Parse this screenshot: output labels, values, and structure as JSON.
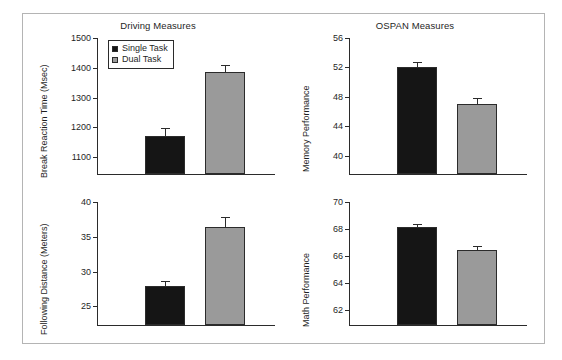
{
  "figure": {
    "background": "#ffffff",
    "frame_color": "#b4b4b4"
  },
  "legend": {
    "entries": [
      {
        "label": "Single Task",
        "color": "#151515",
        "key": "single"
      },
      {
        "label": "Dual Task",
        "color": "#9a9a9a",
        "key": "dual"
      }
    ]
  },
  "chart_data": [
    {
      "type": "bar",
      "panel": "top-left",
      "title": "Driving Measures",
      "xlabel": "",
      "ylabel": "Break Reaction Time (Msec)",
      "categories": [
        "Single Task",
        "Dual Task"
      ],
      "values": [
        1168,
        1383
      ],
      "errors": [
        30,
        28
      ],
      "ylim": [
        1040,
        1500
      ],
      "yticks": [
        1100,
        1200,
        1300,
        1400,
        1500
      ],
      "ytick_labels": [
        "1100",
        "1200",
        "1300",
        "1400",
        "1500"
      ],
      "grid": false,
      "legend_position": "upper left",
      "colors": [
        "#151515",
        "#9a9a9a"
      ]
    },
    {
      "type": "bar",
      "panel": "top-right",
      "title": "OSPAN Measures",
      "xlabel": "",
      "ylabel": "Memory Performance",
      "categories": [
        "Single Task",
        "Dual Task"
      ],
      "values": [
        51.9,
        46.9
      ],
      "errors": [
        0.8,
        0.9
      ],
      "ylim": [
        37.4,
        56
      ],
      "yticks": [
        40,
        44,
        48,
        52,
        56
      ],
      "ytick_labels": [
        "40",
        "44",
        "48",
        "52",
        "56"
      ],
      "grid": false,
      "legend_position": "none",
      "colors": [
        "#151515",
        "#9a9a9a"
      ]
    },
    {
      "type": "bar",
      "panel": "bottom-left",
      "title": "",
      "xlabel": "",
      "ylabel": "Following Distance (Meters)",
      "categories": [
        "Single Task",
        "Dual Task"
      ],
      "values": [
        27.8,
        36.2
      ],
      "errors": [
        0.9,
        1.7
      ],
      "ylim": [
        22.2,
        40
      ],
      "yticks": [
        25,
        30,
        35,
        40
      ],
      "ytick_labels": [
        "25",
        "30",
        "35",
        "40"
      ],
      "grid": false,
      "legend_position": "none",
      "colors": [
        "#151515",
        "#9a9a9a"
      ]
    },
    {
      "type": "bar",
      "panel": "bottom-right",
      "title": "",
      "xlabel": "",
      "ylabel": "Math Performance",
      "categories": [
        "Single Task",
        "Dual Task"
      ],
      "values": [
        68.1,
        66.4
      ],
      "errors": [
        0.3,
        0.35
      ],
      "ylim": [
        60.8,
        70
      ],
      "yticks": [
        62,
        64,
        66,
        68,
        70
      ],
      "ytick_labels": [
        "62",
        "64",
        "66",
        "68",
        "70"
      ],
      "grid": false,
      "legend_position": "none",
      "colors": [
        "#151515",
        "#9a9a9a"
      ]
    }
  ]
}
